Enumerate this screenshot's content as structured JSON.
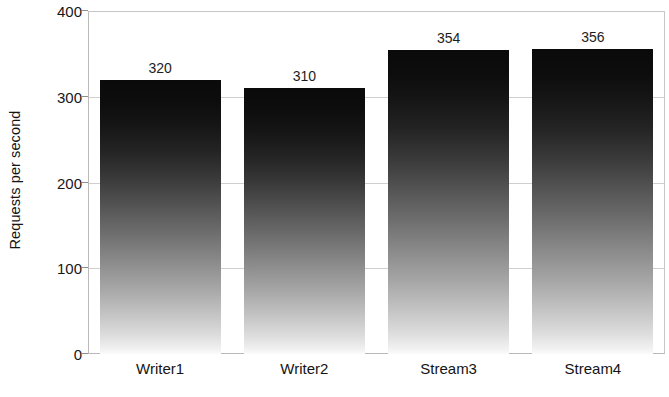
{
  "chart_data": {
    "type": "bar",
    "title": "",
    "xlabel": "",
    "ylabel": "Requests per second",
    "categories": [
      "Writer1",
      "Writer2",
      "Stream3",
      "Stream4"
    ],
    "values": [
      320,
      310,
      354,
      356
    ],
    "value_labels": [
      "320",
      "310",
      "354",
      "356"
    ],
    "ylim": [
      0,
      400
    ],
    "yticks": [
      0,
      100,
      200,
      300,
      400
    ],
    "ytick_labels": [
      "0",
      "100",
      "200",
      "300",
      "400"
    ],
    "grid": "horizontal",
    "legend": "none",
    "bar_fill": "vertical-gradient-black-to-white",
    "colors": {
      "bar_top": "#0a0a0a",
      "bar_bottom": "#fbfbfb",
      "gridline": "#cfcfcf",
      "axis": "#b9b9b9",
      "text": "#141414",
      "background": "#ffffff"
    }
  }
}
